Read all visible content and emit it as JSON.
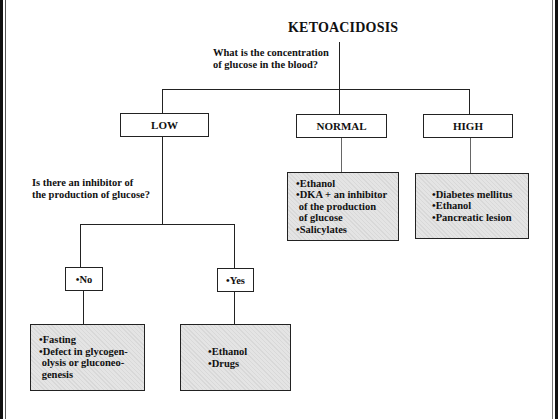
{
  "diagram": {
    "title": "KETOACIDOSIS",
    "question_1": "What is the concentration\nof glucose in the blood?",
    "level_1": {
      "low": {
        "label": "LOW"
      },
      "normal": {
        "label": "NORMAL",
        "causes": [
          "•Ethanol",
          "•DKA + an inhibitor\n of the production\n of glucose",
          "•Salicylates"
        ]
      },
      "high": {
        "label": "HIGH",
        "causes": [
          "•Diabetes mellitus",
          "•Ethanol",
          "•Pancreatic lesion"
        ]
      }
    },
    "question_2": "Is there an inhibitor of\nthe production of glucose?",
    "level_2": {
      "no": {
        "label": "•No",
        "causes": [
          "•Fasting",
          "•Defect in glycogen-\n olysis or gluconeo-\n genesis"
        ]
      },
      "yes": {
        "label": "•Yes",
        "causes": [
          "•Ethanol",
          "•Drugs"
        ]
      }
    }
  }
}
